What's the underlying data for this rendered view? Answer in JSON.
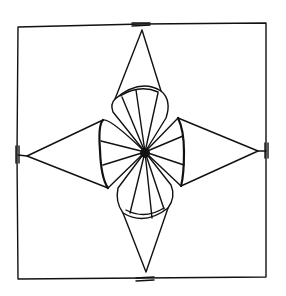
{
  "diagram": {
    "elements": [
      "frame",
      "kite-top",
      "kite-right",
      "kite-bottom",
      "kite-left",
      "petal-top",
      "petal-right",
      "petal-bottom",
      "petal-left",
      "center-dot"
    ],
    "stroke_color": "#111111",
    "background_color": "#ffffff"
  }
}
